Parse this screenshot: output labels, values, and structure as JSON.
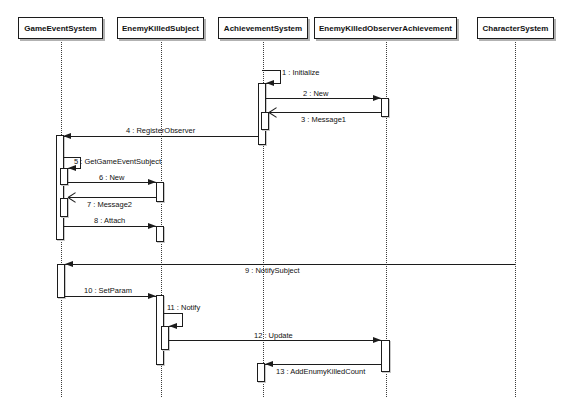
{
  "diagram_type": "uml-sequence-diagram",
  "colors": {
    "background": "#ffffff",
    "line": "#1c1c1c",
    "lifeline": "#3c3c3c",
    "box_shadow": "#b2b2b2",
    "text": "#111111"
  },
  "layout": {
    "width": 572,
    "height": 412,
    "head_top": 17,
    "head_height": 22,
    "lifeline_bottom": 397
  },
  "actors": [
    {
      "label": "GameEventSystem",
      "x": 18,
      "w": 85,
      "cx": 61
    },
    {
      "label": "EnemyKilledSubject",
      "x": 117,
      "w": 87,
      "cx": 161
    },
    {
      "label": "AchievementSystem",
      "x": 218,
      "w": 90,
      "cx": 263
    },
    {
      "label": "EnemyKilledObserverAchievement",
      "x": 314,
      "w": 143,
      "cx": 386
    },
    {
      "label": "CharacterSystem",
      "x": 477,
      "w": 77,
      "cx": 515
    }
  ],
  "activations": [
    {
      "actor": "AchievementSystem",
      "x": 258,
      "y": 83,
      "w": 8,
      "h": 62
    },
    {
      "actor": "AchievementSystem",
      "x": 261,
      "y": 112,
      "w": 8,
      "h": 18
    },
    {
      "actor": "AchievementSystem",
      "x": 257,
      "y": 363,
      "w": 8,
      "h": 19
    },
    {
      "actor": "GameEventSystem",
      "x": 56,
      "y": 135,
      "w": 8,
      "h": 105
    },
    {
      "actor": "GameEventSystem",
      "x": 60,
      "y": 168,
      "w": 8,
      "h": 17
    },
    {
      "actor": "GameEventSystem",
      "x": 60,
      "y": 198,
      "w": 8,
      "h": 19
    },
    {
      "actor": "GameEventSystem",
      "x": 57,
      "y": 264,
      "w": 8,
      "h": 34
    },
    {
      "actor": "EnemyKilledSubject",
      "x": 156,
      "y": 182,
      "w": 8,
      "h": 20
    },
    {
      "actor": "EnemyKilledSubject",
      "x": 156,
      "y": 226,
      "w": 8,
      "h": 16
    },
    {
      "actor": "EnemyKilledSubject",
      "x": 156,
      "y": 295,
      "w": 8,
      "h": 70
    },
    {
      "actor": "EnemyKilledSubject",
      "x": 161,
      "y": 326,
      "w": 8,
      "h": 24
    },
    {
      "actor": "EnemyKilledObserverAchievement",
      "x": 381,
      "y": 98,
      "w": 8,
      "h": 19
    },
    {
      "actor": "EnemyKilledObserverAchievement",
      "x": 381,
      "y": 340,
      "w": 9,
      "h": 32
    }
  ],
  "messages": [
    {
      "num": 1,
      "label": "1 : Initialize",
      "kind": "self",
      "start_x": 262,
      "right_x": 280,
      "y_top": 70,
      "y_bot": 83,
      "tip_x": 266,
      "label_x": 282,
      "label_y": 68
    },
    {
      "num": 2,
      "label": "2 : New",
      "kind": "call",
      "from_x": 266,
      "to_x": 381,
      "y": 98,
      "head": "solid",
      "label_x": 303,
      "label_y": 89
    },
    {
      "num": 3,
      "label": "3 : Message1",
      "kind": "return",
      "from_x": 381,
      "to_x": 269,
      "y": 112,
      "head": "open",
      "label_x": 301,
      "label_y": 115
    },
    {
      "num": 4,
      "label": "4 : RegisterObserver",
      "kind": "call",
      "from_x": 258,
      "to_x": 63,
      "y": 136,
      "head": "solid",
      "label_x": 126,
      "label_y": 126
    },
    {
      "num": 5,
      "label": "5 : GetGameEventSubject",
      "kind": "self",
      "start_x": 63,
      "right_x": 80,
      "y_top": 157,
      "y_bot": 168,
      "tip_x": 68,
      "label_x": 74,
      "label_y": 157
    },
    {
      "num": 6,
      "label": "6 : New",
      "kind": "call",
      "from_x": 68,
      "to_x": 156,
      "y": 182,
      "head": "solid",
      "label_x": 99,
      "label_y": 173
    },
    {
      "num": 7,
      "label": "7 : Message2",
      "kind": "return",
      "from_x": 156,
      "to_x": 68,
      "y": 197,
      "head": "open",
      "label_x": 87,
      "label_y": 200
    },
    {
      "num": 8,
      "label": "8 : Attach",
      "kind": "call",
      "from_x": 63,
      "to_x": 156,
      "y": 226,
      "head": "solid",
      "label_x": 94,
      "label_y": 216
    },
    {
      "num": 9,
      "label": "9 : NotifySubject",
      "kind": "call",
      "from_x": 515,
      "to_x": 65,
      "y": 264,
      "head": "solid",
      "label_x": 245,
      "label_y": 266
    },
    {
      "num": 10,
      "label": "10 : SetParam",
      "kind": "call",
      "from_x": 65,
      "to_x": 156,
      "y": 296,
      "head": "solid",
      "label_x": 84,
      "label_y": 286
    },
    {
      "num": 11,
      "label": "11 : Notify",
      "kind": "self",
      "start_x": 164,
      "right_x": 182,
      "y_top": 313,
      "y_bot": 326,
      "tip_x": 169,
      "label_x": 167,
      "label_y": 303
    },
    {
      "num": 12,
      "label": "12 : Update",
      "kind": "call",
      "from_x": 169,
      "to_x": 381,
      "y": 340,
      "head": "solid",
      "label_x": 254,
      "label_y": 331
    },
    {
      "num": 13,
      "label": "13 : AddEnumyKilledCount",
      "kind": "call",
      "from_x": 381,
      "to_x": 265,
      "y": 364,
      "head": "solid",
      "label_x": 276,
      "label_y": 367
    }
  ]
}
